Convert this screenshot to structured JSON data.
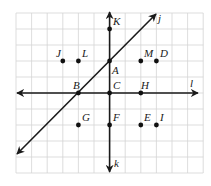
{
  "figure": {
    "grid": {
      "columns": 12,
      "rows": 10,
      "x0": 16,
      "y0": 13,
      "cell_w": 15.6,
      "cell_h": 16,
      "line_color": "#d4d4d4"
    },
    "lines": [
      {
        "name": "j",
        "label": "j",
        "x1": 17,
        "y1": 154,
        "x2": 156,
        "y2": 14,
        "label_x": 158,
        "label_y": 22,
        "arrows": "both"
      },
      {
        "name": "k",
        "label": "k",
        "x1": 109.6,
        "y1": 12,
        "x2": 109.6,
        "y2": 172,
        "label_x": 114,
        "label_y": 167,
        "arrows": "both"
      },
      {
        "name": "l",
        "label": "l",
        "x1": 17,
        "y1": 93,
        "x2": 198,
        "y2": 93,
        "label_x": 190,
        "label_y": 87,
        "arrows": "both"
      }
    ],
    "points": [
      {
        "label": "K",
        "x": 109.6,
        "y": 29,
        "lx": 113,
        "ly": 25
      },
      {
        "label": "J",
        "x": 62.8,
        "y": 61,
        "lx": 56,
        "ly": 57
      },
      {
        "label": "L",
        "x": 78.4,
        "y": 61,
        "lx": 82,
        "ly": 57
      },
      {
        "label": "A",
        "x": 109.6,
        "y": 61,
        "lx": 112,
        "ly": 74
      },
      {
        "label": "M",
        "x": 140.8,
        "y": 61,
        "lx": 144,
        "ly": 57
      },
      {
        "label": "D",
        "x": 156.4,
        "y": 61,
        "lx": 160,
        "ly": 57
      },
      {
        "label": "B",
        "x": 78.4,
        "y": 93,
        "lx": 73,
        "ly": 89
      },
      {
        "label": "C",
        "x": 109.6,
        "y": 93,
        "lx": 113,
        "ly": 89
      },
      {
        "label": "H",
        "x": 140.8,
        "y": 93,
        "lx": 141,
        "ly": 89
      },
      {
        "label": "G",
        "x": 78.4,
        "y": 125,
        "lx": 82,
        "ly": 121
      },
      {
        "label": "F",
        "x": 109.6,
        "y": 125,
        "lx": 113,
        "ly": 121
      },
      {
        "label": "E",
        "x": 140.8,
        "y": 125,
        "lx": 144,
        "ly": 121
      },
      {
        "label": "I",
        "x": 156.4,
        "y": 125,
        "lx": 160,
        "ly": 121
      }
    ],
    "colors": {
      "line": "#1a1a1a",
      "point": "#111111",
      "background": "#ffffff"
    }
  }
}
